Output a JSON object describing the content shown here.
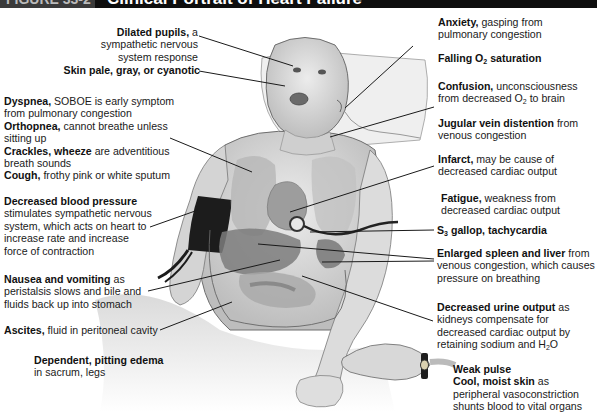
{
  "header": {
    "figure_label": "FIGURE 33-2",
    "title": "Clinical Portrait of Heart Failure"
  },
  "colors": {
    "header_bg": "#0e0e0e",
    "header_fig_bg": "#3a3a3a",
    "text": "#111111",
    "leader_line": "#1a1a1a",
    "illustration_skin": "#d8d8d8",
    "illustration_organ": "#8f8f8f",
    "bp_cuff": "#1c1c1c"
  },
  "labels_left": [
    {
      "id": "dilated-pupils",
      "bold": "Dilated pupils,",
      "text": " a sympathetic nervous system response"
    },
    {
      "id": "skin-pale",
      "bold": "Skin pale, gray, or cyanotic",
      "text": ""
    },
    {
      "id": "dyspnea",
      "bold": "Dyspnea,",
      "text": " SOBOE is early symptom from pulmonary congestion"
    },
    {
      "id": "orthopnea",
      "bold": "Orthopnea,",
      "text": " cannot breathe unless sitting up"
    },
    {
      "id": "crackles",
      "bold": "Crackles, wheeze",
      "text": " are adventitious breath sounds"
    },
    {
      "id": "cough",
      "bold": "Cough,",
      "text": " frothy pink or white sputum"
    },
    {
      "id": "decreased-bp",
      "bold": "Decreased blood pressure",
      "text": "stimulates sympathetic nervous system, which acts on heart to increase rate and increase force of contraction"
    },
    {
      "id": "nausea",
      "bold": "Nausea and vomiting",
      "text": " as peristalsis slows and bile and fluids back up into stomach"
    },
    {
      "id": "ascites",
      "bold": "Ascites,",
      "text": " fluid in peritoneal cavity"
    },
    {
      "id": "edema",
      "bold": "Dependent, pitting edema",
      "text": "in sacrum, legs"
    }
  ],
  "labels_right": [
    {
      "id": "anxiety",
      "bold": "Anxiety,",
      "text": " gasping from pulmonary congestion"
    },
    {
      "id": "falling-o2",
      "bold_pre": "Falling O",
      "sub": "2",
      "bold_post": " saturation"
    },
    {
      "id": "confusion",
      "bold": "Confusion,",
      "text_pre": " unconsciousness from decreased O",
      "sub": "2",
      "text_post": " to brain"
    },
    {
      "id": "jvd",
      "bold": "Jugular vein distention",
      "text": " from venous congestion"
    },
    {
      "id": "infarct",
      "bold": "Infarct,",
      "text": " may be cause of decreased cardiac output"
    },
    {
      "id": "fatigue",
      "bold": "Fatigue,",
      "text": " weakness from decreased cardiac output"
    },
    {
      "id": "s3-gallop",
      "bold_pre": "S",
      "sub": "3",
      "bold_post": " gallop, tachycardia"
    },
    {
      "id": "spleen-liver",
      "bold": "Enlarged spleen and liver",
      "text": " from venous congestion, which causes pressure on breathing"
    },
    {
      "id": "urine",
      "bold": "Decreased urine output",
      "text_pre": " as kidneys compensate for decreased cardiac output by retaining sodium and H",
      "sub": "2",
      "text_post": "O"
    },
    {
      "id": "weak-pulse",
      "bold": "Weak pulse",
      "text": ""
    },
    {
      "id": "cool-skin",
      "bold": "Cool, moist skin",
      "text": " as peripheral vasoconstriction shunts blood to vital organs"
    }
  ]
}
